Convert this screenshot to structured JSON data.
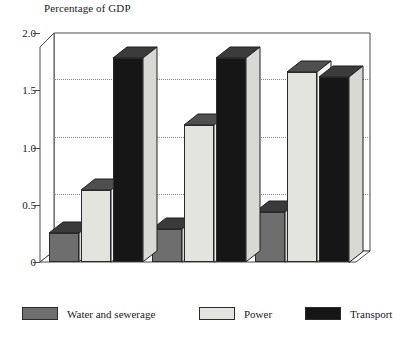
{
  "chart_data": {
    "type": "bar",
    "title": "Percentage of GDP",
    "xlabel": "",
    "ylabel": "Percentage of GDP",
    "categories": [
      "1960s",
      "1970s",
      "1980s"
    ],
    "series": [
      {
        "name": "Water and sewerage",
        "color": "#6e6e6e",
        "values": [
          0.25,
          0.29,
          0.44
        ]
      },
      {
        "name": "Power",
        "color": "#e3e3e0",
        "values": [
          0.63,
          1.2,
          1.66
        ]
      },
      {
        "name": "Transport",
        "color": "#161616",
        "values": [
          1.78,
          1.78,
          1.62
        ]
      }
    ],
    "ylim": [
      0,
      2.0
    ],
    "yticks": [
      "0",
      "0.5",
      "1.0",
      "1.5",
      "2.0"
    ],
    "ytick_values": [
      0,
      0.5,
      1.0,
      1.5,
      2.0
    ],
    "grid": true,
    "grid_axis": "y",
    "legend_position": "bottom",
    "three_d": true
  },
  "axis": {
    "title": "Percentage of GDP",
    "ticks": [
      {
        "label": "2.0",
        "value": 2.0
      },
      {
        "label": "1.5",
        "value": 1.5
      },
      {
        "label": "1.0",
        "value": 1.0
      },
      {
        "label": "0.5",
        "value": 0.5
      },
      {
        "label": "0",
        "value": 0
      }
    ]
  },
  "categories": [
    {
      "label": "1960s"
    },
    {
      "label": "1970s"
    },
    {
      "label": "1980s"
    }
  ],
  "legend": [
    {
      "label": "Water and sewerage",
      "color": "#6e6e6e"
    },
    {
      "label": "Power",
      "color": "#e3e3e0"
    },
    {
      "label": "Transport",
      "color": "#161616"
    }
  ]
}
